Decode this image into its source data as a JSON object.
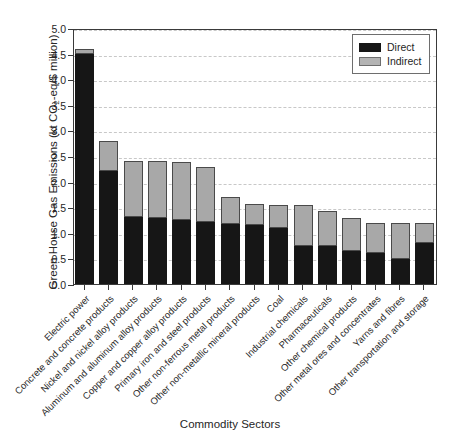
{
  "chart_data": {
    "type": "bar",
    "stacked": true,
    "title": "",
    "xlabel": "Commodity Sectors",
    "ylabel": "Green House Gas Emissions (kt CO2-eq/$ million)",
    "ylabel_parts": {
      "pre": "Green House Gas Emissions (kt CO",
      "sub": "2",
      "post": "-eq/$ million)"
    },
    "ylim": [
      0.0,
      5.0
    ],
    "ytick_labels": [
      "0.0",
      "0.5",
      "1.0",
      "1.5",
      "2.0",
      "2.5",
      "3.0",
      "3.5",
      "4.0",
      "4.5",
      "5.0"
    ],
    "ytick_values": [
      0.0,
      0.5,
      1.0,
      1.5,
      2.0,
      2.5,
      3.0,
      3.5,
      4.0,
      4.5,
      5.0
    ],
    "grid": true,
    "grid_style": "dashed",
    "legend_position": "top-right",
    "categories": [
      "Electric power",
      "Concrete and concrete products",
      "Nickel and nickel alloy products",
      "Aluminum and aluminum alloy products",
      "Copper and copper alloy products",
      "Primary iron and steel products",
      "Other non-ferrous metal products",
      "Other non-metallic mineral products",
      "Coal",
      "Industrial chemicals",
      "Pharmaceuticals",
      "Other chemical products",
      "Other metal ores and concentrates",
      "Yarns and fibres",
      "Other transportation and storage"
    ],
    "series": [
      {
        "name": "Direct",
        "color": "#161616",
        "values": [
          4.5,
          2.2,
          1.3,
          1.28,
          1.25,
          1.21,
          1.18,
          1.15,
          1.1,
          0.75,
          0.75,
          0.65,
          0.6,
          0.48,
          0.8
        ]
      },
      {
        "name": "Indirect",
        "color": "#a8a8a8",
        "values": [
          0.1,
          0.6,
          1.1,
          1.12,
          1.13,
          1.08,
          0.52,
          0.41,
          0.45,
          0.8,
          0.67,
          0.63,
          0.6,
          0.72,
          0.4
        ]
      }
    ],
    "totals": [
      4.6,
      2.8,
      2.4,
      2.4,
      2.38,
      2.29,
      1.7,
      1.56,
      1.55,
      1.55,
      1.42,
      1.28,
      1.2,
      1.2,
      1.2
    ]
  },
  "legend": {
    "entries": [
      {
        "label": "Direct",
        "color": "#161616"
      },
      {
        "label": "Indirect",
        "color": "#a8a8a8"
      }
    ]
  }
}
